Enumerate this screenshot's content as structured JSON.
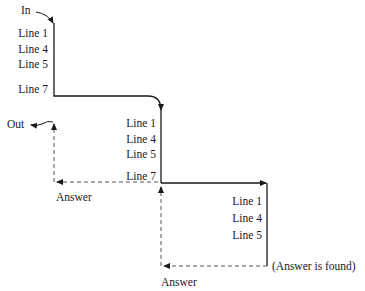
{
  "diagram": {
    "type": "recursive-call-trace",
    "colors": {
      "line": "#1a1a1a",
      "dashed": "#555555",
      "background": "#ffffff"
    },
    "entry_label": "In",
    "exit_label": "Out",
    "levels": [
      {
        "level": 1,
        "lines": [
          "Line 1",
          "Line 4",
          "Line 5",
          "Line 7"
        ]
      },
      {
        "level": 2,
        "lines": [
          "Line 1",
          "Line 4",
          "Line 5",
          "Line 7"
        ]
      },
      {
        "level": 3,
        "lines": [
          "Line 1",
          "Line 4",
          "Line 5"
        ]
      }
    ],
    "return_labels": {
      "level3_note": "(Answer is found)",
      "level3_answer": "Answer",
      "level2_answer": "Answer"
    }
  }
}
